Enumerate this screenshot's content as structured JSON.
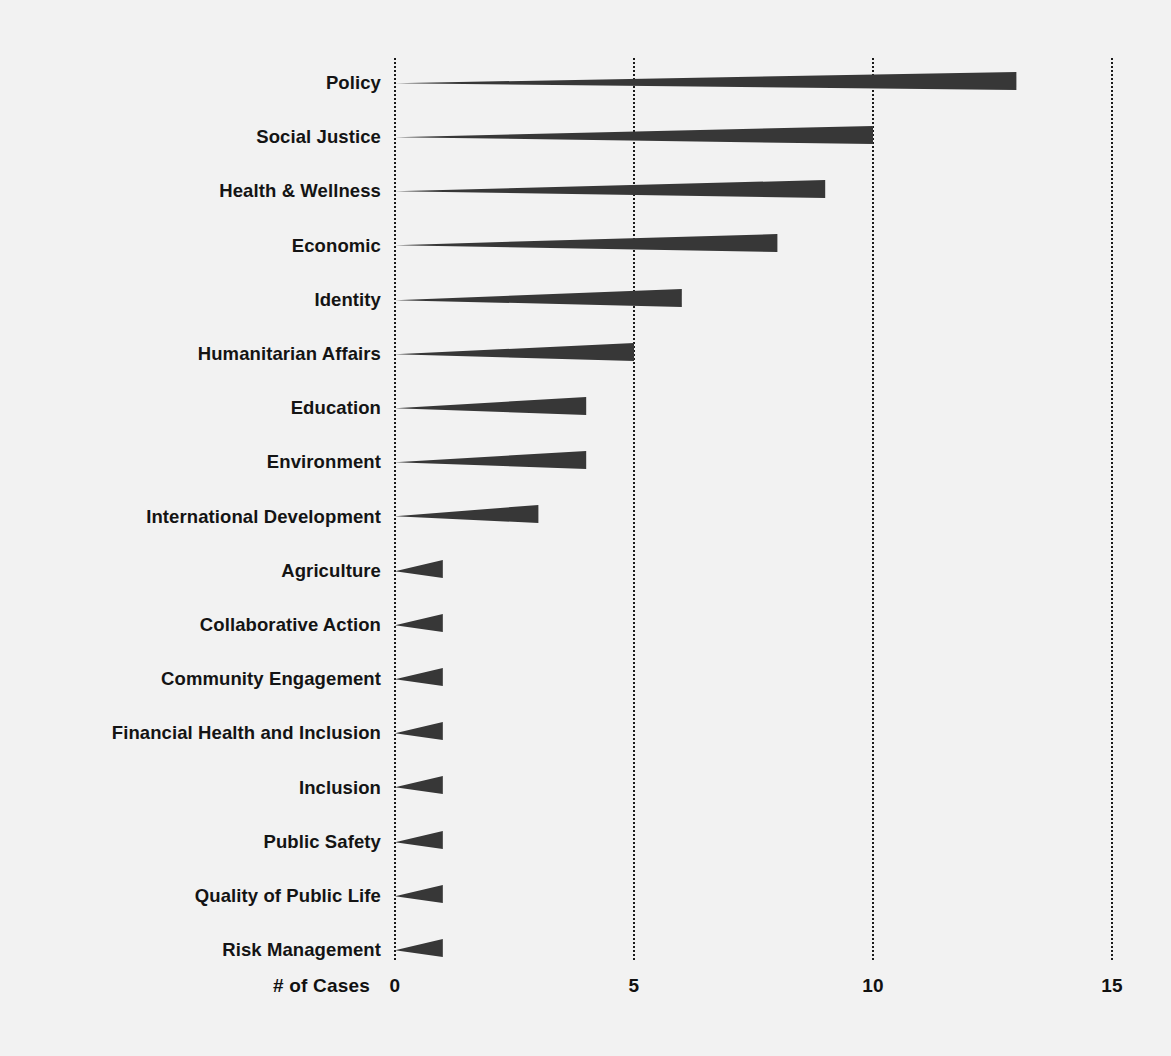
{
  "chart_data": {
    "type": "bar",
    "orientation": "horizontal",
    "title": "",
    "subtitle": "",
    "xlabel": "# of Cases",
    "ylabel": "",
    "xlim": [
      0,
      15
    ],
    "xticks": [
      0,
      5,
      10,
      15
    ],
    "xtick_labels": [
      "0",
      "5",
      "10",
      "15"
    ],
    "grid": "vertical-dotted",
    "legend": "none",
    "bar_style": "wedge-triangle",
    "bar_color": "#373737",
    "background_color": "#f2f2f2",
    "categories": [
      "Policy",
      "Social Justice",
      "Health & Wellness",
      "Economic",
      "Identity",
      "Humanitarian Affairs",
      "Education",
      "Environment",
      "International Development",
      "Agriculture",
      "Collaborative Action",
      "Community Engagement",
      "Financial Health and Inclusion",
      "Inclusion",
      "Public Safety",
      "Quality of Public Life",
      "Risk Management"
    ],
    "values": [
      13,
      10,
      9,
      8,
      6,
      5,
      4,
      4,
      3,
      1,
      1,
      1,
      1,
      1,
      1,
      1,
      1
    ]
  }
}
